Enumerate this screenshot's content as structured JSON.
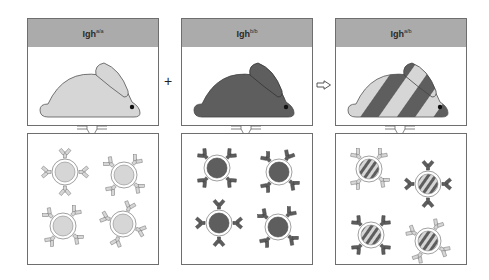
{
  "colors": {
    "header_bg": "#ababab",
    "border": "#6e6e6e",
    "allele_a": "#d6d6d6",
    "allele_b": "#5e5e5e",
    "outline": "#555555"
  },
  "panels": [
    {
      "id": "aa",
      "label_main": "Igh",
      "label_sup": "a/a",
      "rabbit": "light",
      "cells": "light"
    },
    {
      "id": "bb",
      "label_main": "Igh",
      "label_sup": "b/b",
      "rabbit": "dark",
      "cells": "dark"
    },
    {
      "id": "ab",
      "label_main": "Igh",
      "label_sup": "a/b",
      "rabbit": "striped",
      "cells": "striped-mixed"
    }
  ],
  "operators": {
    "plus": "+",
    "arrow": "⇨"
  }
}
